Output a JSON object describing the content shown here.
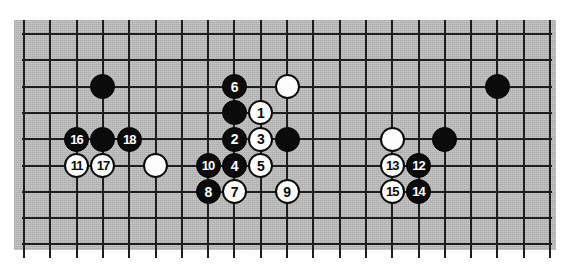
{
  "diagram": {
    "kind": "go-board-diagram",
    "board_color": "#b9b9b9",
    "line_color": "#1d1d1d",
    "black_color": "#0b0b0b",
    "white_color": "#fdfdfd",
    "grid": {
      "columns": 21,
      "rows": 9,
      "spacing_px": 26.3,
      "origin_x": 24,
      "origin_y": 34
    },
    "stones": [
      {
        "id": "stone-black-c3r2",
        "color": "black",
        "label": "",
        "col": 3,
        "row": 2
      },
      {
        "id": "stone-black-c8r2",
        "color": "black",
        "label": "6",
        "col": 8,
        "row": 2
      },
      {
        "id": "stone-white-c10r2",
        "color": "white",
        "label": "",
        "col": 10,
        "row": 2
      },
      {
        "id": "stone-black-c18r2",
        "color": "black",
        "label": "",
        "col": 18,
        "row": 2
      },
      {
        "id": "stone-black-c8r3",
        "color": "black",
        "label": "",
        "col": 8,
        "row": 3
      },
      {
        "id": "stone-white-c9r3",
        "color": "white",
        "label": "1",
        "col": 9,
        "row": 3
      },
      {
        "id": "stone-black-c2r4",
        "color": "black",
        "label": "16",
        "col": 2,
        "row": 4
      },
      {
        "id": "stone-black-c3r4",
        "color": "black",
        "label": "",
        "col": 3,
        "row": 4
      },
      {
        "id": "stone-black-c4r4",
        "color": "black",
        "label": "18",
        "col": 4,
        "row": 4
      },
      {
        "id": "stone-black-c8r4",
        "color": "black",
        "label": "2",
        "col": 8,
        "row": 4
      },
      {
        "id": "stone-white-c9r4",
        "color": "white",
        "label": "3",
        "col": 9,
        "row": 4
      },
      {
        "id": "stone-black-c10r4",
        "color": "black",
        "label": "",
        "col": 10,
        "row": 4
      },
      {
        "id": "stone-white-c14r4",
        "color": "white",
        "label": "",
        "col": 14,
        "row": 4
      },
      {
        "id": "stone-black-c16r4",
        "color": "black",
        "label": "",
        "col": 16,
        "row": 4
      },
      {
        "id": "stone-white-c2r5",
        "color": "white",
        "label": "11",
        "col": 2,
        "row": 5
      },
      {
        "id": "stone-white-c3r5",
        "color": "white",
        "label": "17",
        "col": 3,
        "row": 5
      },
      {
        "id": "stone-white-c5r5",
        "color": "white",
        "label": "",
        "col": 5,
        "row": 5
      },
      {
        "id": "stone-black-c7r5",
        "color": "black",
        "label": "10",
        "col": 7,
        "row": 5
      },
      {
        "id": "stone-black-c8r5",
        "color": "black",
        "label": "4",
        "col": 8,
        "row": 5
      },
      {
        "id": "stone-white-c9r5",
        "color": "white",
        "label": "5",
        "col": 9,
        "row": 5
      },
      {
        "id": "stone-white-c14r5",
        "color": "white",
        "label": "13",
        "col": 14,
        "row": 5
      },
      {
        "id": "stone-black-c15r5",
        "color": "black",
        "label": "12",
        "col": 15,
        "row": 5
      },
      {
        "id": "stone-black-c7r6",
        "color": "black",
        "label": "8",
        "col": 7,
        "row": 6
      },
      {
        "id": "stone-white-c8r6",
        "color": "white",
        "label": "7",
        "col": 8,
        "row": 6
      },
      {
        "id": "stone-white-c10r6",
        "color": "white",
        "label": "9",
        "col": 10,
        "row": 6
      },
      {
        "id": "stone-white-c14r6",
        "color": "white",
        "label": "15",
        "col": 14,
        "row": 6
      },
      {
        "id": "stone-black-c15r6",
        "color": "black",
        "label": "14",
        "col": 15,
        "row": 6
      }
    ]
  }
}
